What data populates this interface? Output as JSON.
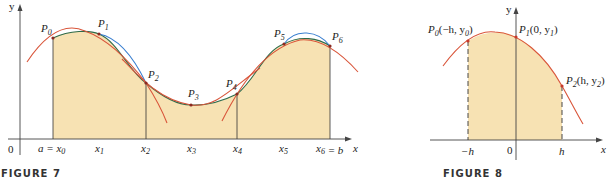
{
  "figure7": {
    "caption": "FIGURE 7",
    "axis": {
      "y_label": "y",
      "x_label": "x",
      "origin_label": "0"
    },
    "points": [
      "P0",
      "P1",
      "P2",
      "P3",
      "P4",
      "P5",
      "P6"
    ],
    "x_ticks": [
      "a = x0",
      "x1",
      "x2",
      "x3",
      "x4",
      "x5",
      "x6 = b"
    ],
    "colors": {
      "fill": "#f7e2b3",
      "parabola": "#d9553a",
      "curve_blue": "#3a7fd0",
      "curve_green": "#2e6b4a",
      "axes": "#444444"
    }
  },
  "figure8": {
    "caption": "FIGURE 8",
    "axis": {
      "y_label": "y",
      "x_label": "x",
      "origin_label": "0"
    },
    "points": [
      {
        "name": "P0",
        "coords": "(−h, y0)"
      },
      {
        "name": "P1",
        "coords": "(0, y1)"
      },
      {
        "name": "P2",
        "coords": "(h, y2)"
      }
    ],
    "x_ticks": [
      "−h",
      "0",
      "h"
    ],
    "colors": {
      "fill": "#f7e2b3",
      "parabola": "#d9553a"
    }
  }
}
